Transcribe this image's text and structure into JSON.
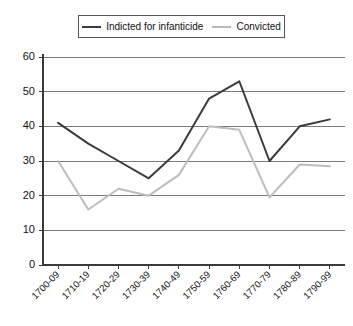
{
  "legend": {
    "entries": [
      {
        "label": "Indicted for infanticide",
        "color": "#3b3b3b",
        "swatch": "line-swatch-dark"
      },
      {
        "label": "Convicted",
        "color": "#bdbdbd",
        "swatch": "line-swatch-light"
      }
    ]
  },
  "chart_data": {
    "type": "line",
    "title": "",
    "xlabel": "",
    "ylabel": "",
    "ylim": [
      0,
      60
    ],
    "ytick_step": 10,
    "yticks": [
      "0",
      "10",
      "20",
      "30",
      "40",
      "50",
      "60"
    ],
    "grid": true,
    "legend_position": "top-center",
    "categories": [
      "1700-09",
      "1710-19",
      "1720-29",
      "1730-39",
      "1740-49",
      "1750-59",
      "1760-69",
      "1770-79",
      "1780-89",
      "1790-99"
    ],
    "series": [
      {
        "name": "Indicted for infanticide",
        "color": "#3b3b3b",
        "values": [
          41,
          35,
          30,
          25,
          33,
          48,
          53,
          30,
          40,
          42
        ]
      },
      {
        "name": "Convicted",
        "color": "#bdbdbd",
        "values": [
          30,
          16,
          22,
          20,
          26,
          40,
          39,
          19.5,
          29,
          28.5
        ]
      }
    ]
  }
}
